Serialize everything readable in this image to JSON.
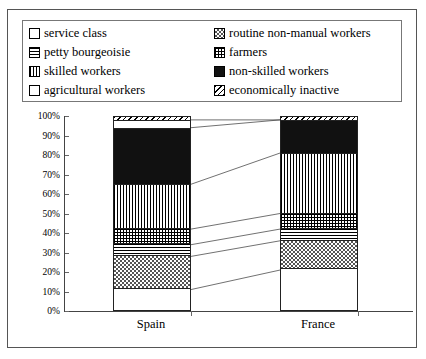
{
  "chart_data": {
    "type": "bar",
    "stacked": true,
    "title": "",
    "xlabel": "",
    "ylabel": "",
    "categories": [
      "Spain",
      "France"
    ],
    "ylim": [
      0,
      100
    ],
    "ytick_labels": [
      "0%",
      "10%",
      "20%",
      "30%",
      "40%",
      "50%",
      "60%",
      "70%",
      "80%",
      "90%",
      "100%"
    ],
    "ytick_values": [
      0,
      10,
      20,
      30,
      40,
      50,
      60,
      70,
      80,
      90,
      100
    ],
    "grid": false,
    "legend_position": "top",
    "series": [
      {
        "name": "service class",
        "pattern": "blank",
        "values": [
          11,
          21
        ]
      },
      {
        "name": "routine non-manual workers",
        "pattern": "checker",
        "values": [
          17,
          15
        ]
      },
      {
        "name": "petty bourgeoisie",
        "pattern": "hlines",
        "values": [
          6,
          6
        ]
      },
      {
        "name": "farmers",
        "pattern": "grid",
        "values": [
          8,
          8
        ]
      },
      {
        "name": "skilled workers",
        "pattern": "vlines",
        "values": [
          23,
          31
        ]
      },
      {
        "name": "non-skilled workers",
        "pattern": "solid",
        "values": [
          29,
          17
        ]
      },
      {
        "name": "agricultural workers",
        "pattern": "dots-light",
        "values": [
          4,
          0
        ]
      },
      {
        "name": "economically inactive",
        "pattern": "diag",
        "values": [
          2,
          2
        ]
      }
    ]
  },
  "legend": {
    "items": [
      {
        "label": "service class",
        "pattern": "blank"
      },
      {
        "label": "routine non-manual workers",
        "pattern": "checker"
      },
      {
        "label": "petty bourgeoisie",
        "pattern": "hlines"
      },
      {
        "label": "farmers",
        "pattern": "grid"
      },
      {
        "label": "skilled workers",
        "pattern": "vlines"
      },
      {
        "label": "non-skilled workers",
        "pattern": "solid"
      },
      {
        "label": "agricultural workers",
        "pattern": "dots-light"
      },
      {
        "label": "economically inactive",
        "pattern": "diag"
      }
    ]
  }
}
